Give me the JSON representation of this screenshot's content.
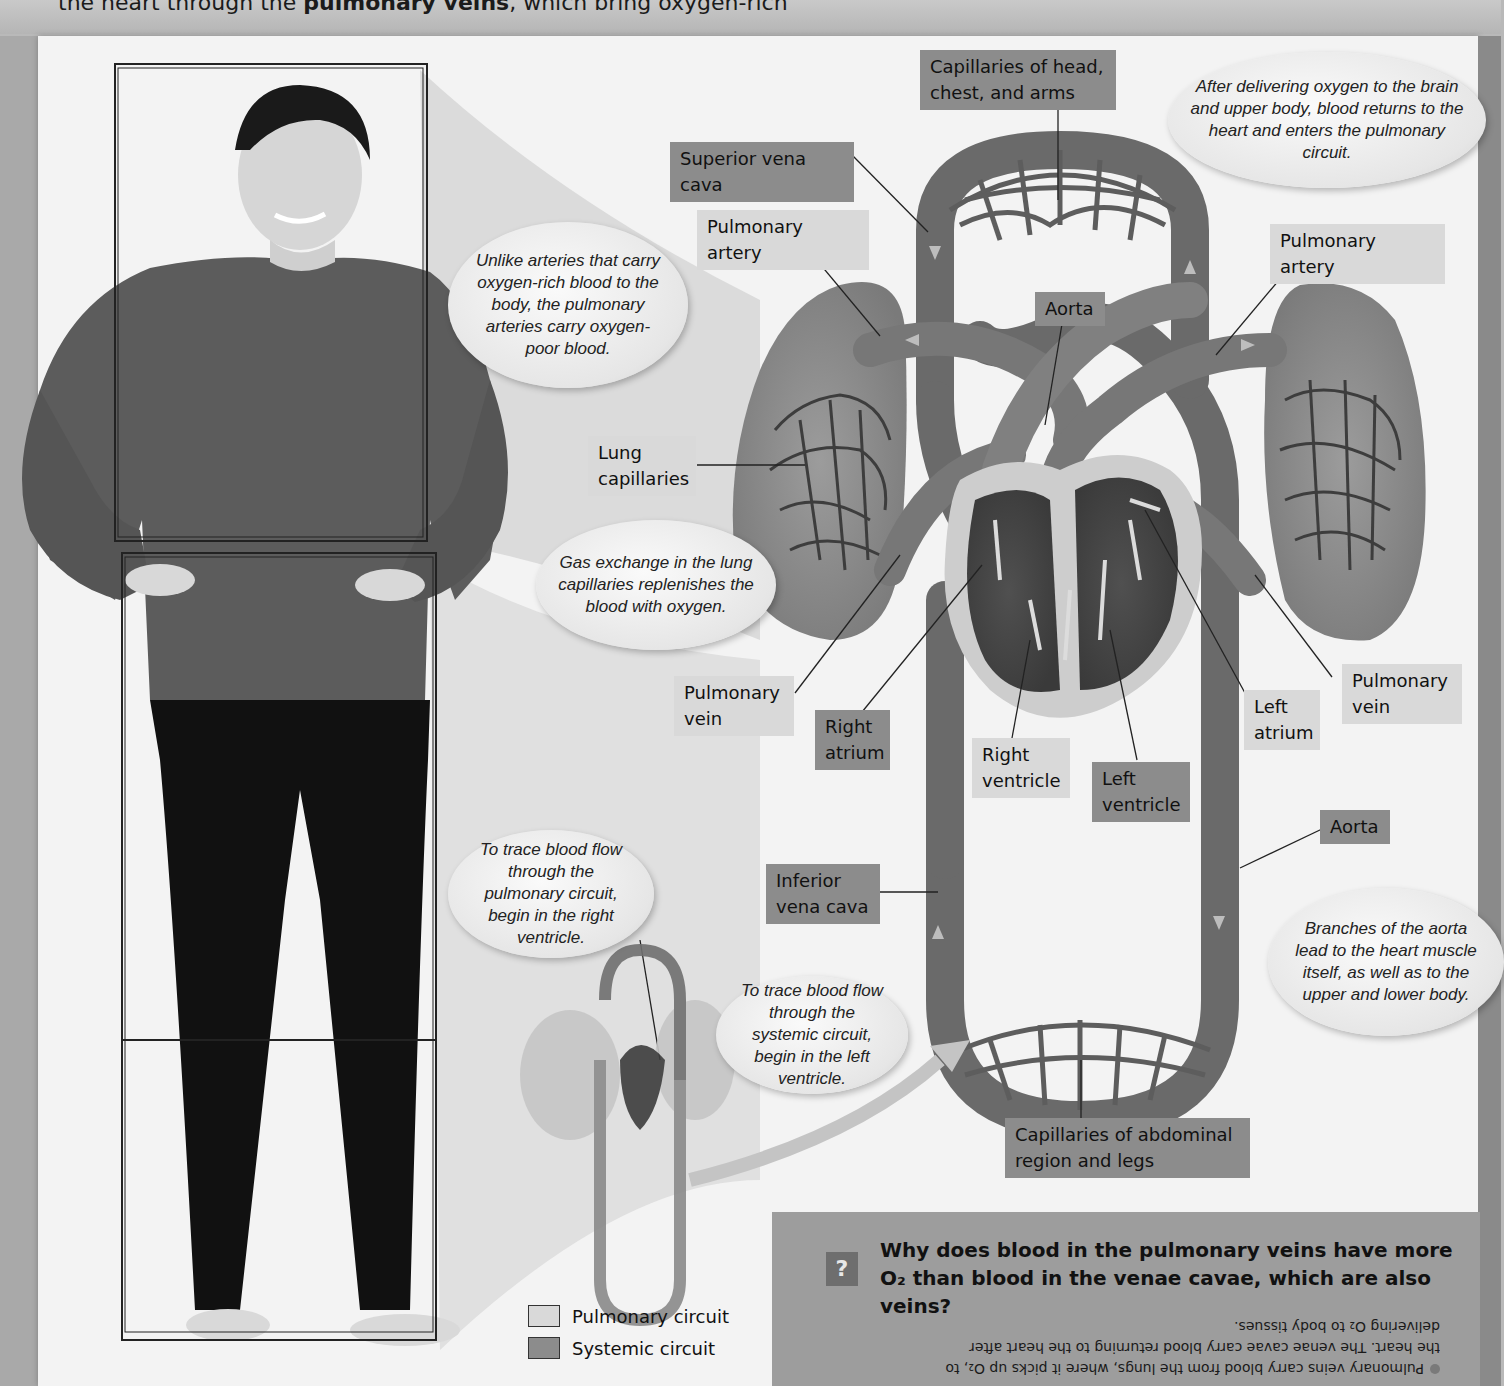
{
  "header": {
    "text_before": "the heart through the ",
    "bold_term": "pulmonary veins",
    "text_after": ", which bring oxygen-rich"
  },
  "labels": {
    "capillaries_head": "Capillaries of head, chest, and arms",
    "superior_vena_cava": "Superior vena cava",
    "pulmonary_artery_left": "Pulmonary artery",
    "pulmonary_artery_right": "Pulmonary artery",
    "aorta_top": "Aorta",
    "lung_capillaries": "Lung capillaries",
    "pulmonary_vein_left": "Pulmonary vein",
    "right_atrium": "Right atrium",
    "right_ventricle": "Right ventricle",
    "left_ventricle": "Left ventricle",
    "left_atrium": "Left atrium",
    "pulmonary_vein_right": "Pulmonary vein",
    "aorta_bottom": "Aorta",
    "inferior_vena_cava": "Inferior vena cava",
    "capillaries_abdominal": "Capillaries of abdominal region and legs"
  },
  "bubbles": {
    "after_delivering": "After delivering oxygen to the brain and upper body, blood returns to the heart and enters the pulmonary circuit.",
    "unlike_arteries": "Unlike arteries that carry oxygen-rich blood to the body, the pulmonary arteries carry oxygen-poor blood.",
    "gas_exchange": "Gas exchange in the lung capillaries replenishes the blood with oxygen.",
    "trace_pulmonary": "To trace blood flow through the pulmonary circuit, begin in the right ventricle.",
    "trace_systemic": "To trace blood flow through the systemic circuit, begin in the left ventricle.",
    "branches_aorta": "Branches of the aorta lead to the heart muscle itself, as well as to the upper and lower body."
  },
  "legend": {
    "items": [
      {
        "label": "Pulmonary circuit",
        "color": "#d9d9d9"
      },
      {
        "label": "Systemic circuit",
        "color": "#8c8c8c"
      }
    ]
  },
  "question": {
    "icon": "?",
    "text": "Why does blood in the pulmonary veins have more O₂ than blood in the venae cavae, which are also veins?",
    "answer_upside_down": "Pulmonary veins carry blood from the lungs, where it picks up O₂, to the heart. The venae cavae carry blood returning to the heart after delivering O₂ to body tissues."
  },
  "colors": {
    "systemic": "#8c8c8c",
    "pulmonary": "#d9d9d9",
    "vessel": "#6f6f6f",
    "lung": "#8e8e8e",
    "page": "#f3f3f3"
  }
}
